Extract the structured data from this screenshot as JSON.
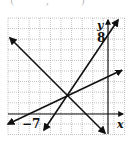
{
  "top_fragment": "( , )",
  "graph": {
    "grid": {
      "x0": 8,
      "y0": 18,
      "cell": 10.6,
      "cols": 11,
      "rows": 11
    },
    "axes": {
      "x_axis_label": "x",
      "y_axis_label": "y",
      "y_tick_label": "8",
      "x_tick_label": "−7"
    },
    "lines": [
      {
        "name": "decreasing-line",
        "from": [
          10,
          38
        ],
        "to": [
          105,
          133
        ],
        "arrows": "both"
      },
      {
        "name": "steep-increasing-line",
        "from": [
          44,
          130
        ],
        "to": [
          118,
          20
        ],
        "arrows": "both"
      },
      {
        "name": "shallow-increasing-line",
        "from": [
          8,
          124
        ],
        "to": [
          122,
          70
        ],
        "arrows": "both"
      }
    ],
    "intersection": [
      67,
      95
    ],
    "colors": {
      "line": "#111111",
      "grid": "#9a9a9a",
      "background": "#ffffff"
    }
  }
}
